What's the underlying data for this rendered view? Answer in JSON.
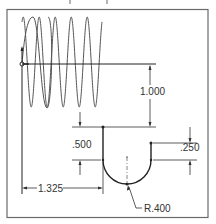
{
  "drawing": {
    "type": "engineering-drawing",
    "colors": {
      "background": "#ffffff",
      "frame": "#6a6a6a",
      "geometry": "#222222",
      "curve": "#555555",
      "dimension": "#333333"
    },
    "dimensions": {
      "vertical_offset": "1.000",
      "left_depth": ".500",
      "right_depth": ".250",
      "horizontal_offset": "1.325",
      "radius": "R.400"
    },
    "features": {
      "sine_wave_cycles": 5,
      "profile": "U-shaped slot with radius bottom"
    }
  }
}
